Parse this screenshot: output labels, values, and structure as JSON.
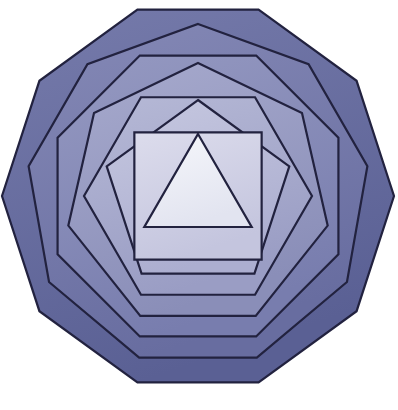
{
  "figure": {
    "background_color": "#ffffff",
    "canvas": {
      "width": 398,
      "height": 410
    },
    "center": {
      "x": 198,
      "y": 196
    },
    "stroke_color": "#22223f",
    "stroke_width": 2.2
  },
  "chart_data": {
    "type": "diagram",
    "layers": [
      {
        "index": 0,
        "name": "decagon",
        "label": "Decagon",
        "sides": 10,
        "radius": 196,
        "rotation_deg": 18,
        "fill": "#6a6fa0",
        "stroke": "#22223f",
        "gradient_from": "#767bab",
        "gradient_to": "#5a6094"
      },
      {
        "index": 1,
        "name": "nonagon",
        "label": "Nonagon",
        "sides": 9,
        "radius": 172,
        "rotation_deg": 0,
        "fill": "#7478a8",
        "stroke": "#22223f",
        "gradient_from": "#8589b6",
        "gradient_to": "#686da0"
      },
      {
        "index": 2,
        "name": "octagon",
        "label": "Octagon",
        "sides": 8,
        "radius": 152,
        "rotation_deg": 22.5,
        "fill": "#8589b4",
        "stroke": "#22223f",
        "gradient_from": "#9599c1",
        "gradient_to": "#787dae"
      },
      {
        "index": 3,
        "name": "heptagon",
        "label": "Heptagon",
        "sides": 7,
        "radius": 133,
        "rotation_deg": 0,
        "fill": "#9699c0",
        "stroke": "#22223f",
        "gradient_from": "#a7aacd",
        "gradient_to": "#8a8eb8"
      },
      {
        "index": 4,
        "name": "hexagon",
        "label": "Hexagon",
        "sides": 6,
        "radius": 114,
        "rotation_deg": 30,
        "fill": "#a6a9cb",
        "stroke": "#22223f",
        "gradient_from": "#b6b9d6",
        "gradient_to": "#9a9dc4"
      },
      {
        "index": 5,
        "name": "pentagon",
        "label": "Pentagon",
        "sides": 5,
        "radius": 96,
        "rotation_deg": 0,
        "fill": "#b8bad6",
        "stroke": "#22223f",
        "gradient_from": "#c6c8e0",
        "gradient_to": "#acaed0"
      },
      {
        "index": 6,
        "name": "square",
        "label": "Square",
        "sides": 4,
        "radius": 90,
        "rotation_deg": 45,
        "fill": "#cfd0e4",
        "stroke": "#22223f",
        "gradient_from": "#dcdcec",
        "gradient_to": "#c4c5de"
      },
      {
        "index": 7,
        "name": "triangle",
        "label": "Triangle",
        "sides": 3,
        "radius": 62,
        "rotation_deg": 0,
        "fill": "#eceef6",
        "stroke": "#22223f",
        "gradient_from": "#f6f7fb",
        "gradient_to": "#e2e4f0"
      }
    ]
  }
}
